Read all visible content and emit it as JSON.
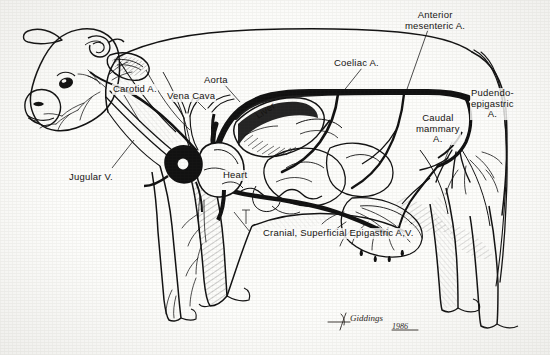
{
  "diagram": {
    "medium": "pen and ink line drawing",
    "ink_color": "#111111",
    "paper_color": "#fdfdfb"
  },
  "labels": [
    {
      "id": "carotid",
      "text": "Carotid A.",
      "x": 112,
      "y": 84,
      "align": "left"
    },
    {
      "id": "vena-cava",
      "text": "Vena Cava",
      "x": 166,
      "y": 91,
      "align": "left"
    },
    {
      "id": "aorta",
      "text": "Aorta",
      "x": 203,
      "y": 75,
      "align": "left"
    },
    {
      "id": "coeliac",
      "text": "Coeliac A.",
      "x": 333,
      "y": 58,
      "align": "left"
    },
    {
      "id": "anterior-mesenteric",
      "text": "Anterior\nmesenteric A.",
      "x": 404,
      "y": 10,
      "align": "left"
    },
    {
      "id": "pudendo-epigastric",
      "text": "Pudendo-\nepigastric\nA.",
      "x": 470,
      "y": 88,
      "align": "left"
    },
    {
      "id": "caudal-mammary",
      "text": "Caudal\nmammary\nA.",
      "x": 415,
      "y": 113,
      "align": "left"
    },
    {
      "id": "jugular",
      "text": "Jugular V.",
      "x": 68,
      "y": 172,
      "align": "left"
    },
    {
      "id": "heart",
      "text": "Heart",
      "x": 222,
      "y": 170,
      "align": "left"
    },
    {
      "id": "liver",
      "text": "Liver",
      "x": 253,
      "y": 104,
      "align": "left",
      "rotated": true
    },
    {
      "id": "cranial-superficial-epigastric",
      "text": "Cranial, Superficial Epigastric A,V.",
      "x": 262,
      "y": 228,
      "align": "left"
    }
  ],
  "signature": {
    "artist": "Giddings",
    "year": "1986",
    "x": 330,
    "y": 320
  },
  "legend_notes": {
    "arteries": "solid black vessels",
    "veins": "open outline vessels"
  }
}
